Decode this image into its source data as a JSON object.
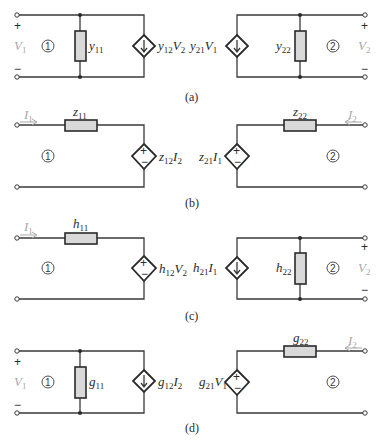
{
  "figures": [
    {
      "id": "a",
      "caption": "(a)",
      "type": "y-parameter",
      "left": {
        "port_voltage": "V",
        "port_voltage_sub": "1",
        "port_number": "1",
        "element": "y",
        "element_sub": "11",
        "source": "y",
        "source_sub": "12",
        "source_var": "V",
        "source_var_sub": "2",
        "source_kind": "current"
      },
      "right": {
        "port_voltage": "V",
        "port_voltage_sub": "2",
        "port_number": "2",
        "element": "y",
        "element_sub": "22",
        "source": "y",
        "source_sub": "21",
        "source_var": "V",
        "source_var_sub": "1",
        "source_kind": "current"
      },
      "plus": "+",
      "minus": "−"
    },
    {
      "id": "b",
      "caption": "(b)",
      "type": "z-parameter",
      "left": {
        "port_current": "I",
        "port_current_sub": "1",
        "port_number": "1",
        "element": "z",
        "element_sub": "11",
        "source": "z",
        "source_sub": "12",
        "source_var": "I",
        "source_var_sub": "2",
        "source_kind": "voltage"
      },
      "right": {
        "port_current": "I",
        "port_current_sub": "2",
        "port_number": "2",
        "element": "z",
        "element_sub": "22",
        "source": "z",
        "source_sub": "21",
        "source_var": "I",
        "source_var_sub": "1",
        "source_kind": "voltage"
      },
      "plus": "+",
      "minus": "−"
    },
    {
      "id": "c",
      "caption": "(c)",
      "type": "h-parameter",
      "left": {
        "port_current": "I",
        "port_current_sub": "1",
        "port_number": "1",
        "element": "h",
        "element_sub": "11",
        "source": "h",
        "source_sub": "12",
        "source_var": "V",
        "source_var_sub": "2",
        "source_kind": "voltage"
      },
      "right": {
        "port_voltage": "V",
        "port_voltage_sub": "2",
        "port_number": "2",
        "element": "h",
        "element_sub": "22",
        "source": "h",
        "source_sub": "21",
        "source_var": "I",
        "source_var_sub": "1",
        "source_kind": "current"
      },
      "plus": "+",
      "minus": "−"
    },
    {
      "id": "d",
      "caption": "(d)",
      "type": "g-parameter",
      "left": {
        "port_voltage": "V",
        "port_voltage_sub": "1",
        "port_number": "1",
        "element": "g",
        "element_sub": "11",
        "source": "g",
        "source_sub": "12",
        "source_var": "I",
        "source_var_sub": "2",
        "source_kind": "current"
      },
      "right": {
        "port_current": "I",
        "port_current_sub": "2",
        "port_number": "2",
        "element": "g",
        "element_sub": "22",
        "source": "g",
        "source_sub": "21",
        "source_var": "V",
        "source_var_sub": "1",
        "source_kind": "voltage"
      },
      "plus": "+",
      "minus": "−"
    }
  ],
  "colors": {
    "wire": "#3a3a3a",
    "resistor_fill": "#d9d9d9",
    "muted_label": "#a8a8a8"
  }
}
